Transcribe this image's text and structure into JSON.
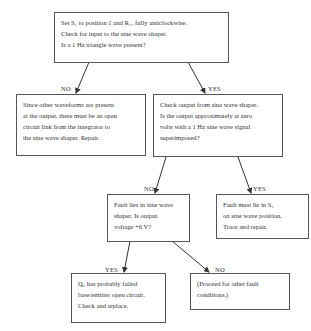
{
  "nodes": {
    "start": {
      "lines": [
        "Set S₁ to position 1 and R₂₇ fully anticlockwise.",
        "Check for input to the sine wave shaper.",
        "Is a 1 Hz triangle wave present?"
      ]
    },
    "no_input": {
      "lines": [
        "Since other waveforms are present",
        "at the output, there must be an open",
        "circuit link from the integrator to",
        "the sine wave shaper.  Repair."
      ]
    },
    "check_output": {
      "lines": [
        "Check output from sine wave shaper.",
        "Is the output approximately at zero",
        "volts with a 1 Hz sine wave signal",
        "superimposed?"
      ]
    },
    "fault_shaper": {
      "lines": [
        "Fault lies in sine wave",
        "shaper.  Is output",
        "voltage +6 V?"
      ]
    },
    "fault_s2": {
      "lines": [
        "Fault must lie in S₂",
        "on sine wave position.",
        "Trace and repair."
      ]
    },
    "q5_failed": {
      "lines": [
        "Q₅ has probably failed",
        "base/emitter open circuit.",
        "Check and replace."
      ]
    },
    "proceed": {
      "lines": [
        "(Proceed for other fault",
        "conditions.)"
      ]
    }
  },
  "edges": {
    "start_no": "NO",
    "start_yes": "YES",
    "check_no": "NO",
    "check_yes": "YES",
    "shaper_yes": "YES",
    "shaper_no": "NO"
  }
}
